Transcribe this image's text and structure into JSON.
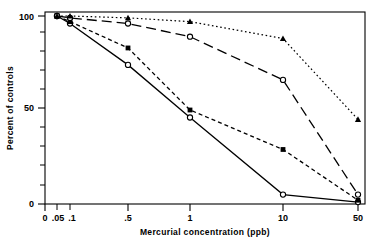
{
  "chart_data": {
    "type": "line",
    "title": "",
    "xlabel": "Mercurial concentration (ppb)",
    "ylabel": "Percent of controls",
    "x": [
      0.05,
      0.1,
      0.5,
      1,
      10,
      50
    ],
    "xtick_labels": [
      "0",
      ".05",
      ".1",
      ".5",
      "1",
      "10",
      "50"
    ],
    "ytick_labels": [
      "0",
      "50",
      "100"
    ],
    "ylim": [
      0,
      100
    ],
    "grid": false,
    "legend": "none",
    "series": [
      {
        "name": "open-circle-solid",
        "marker": "open-circle",
        "line": "solid",
        "x": [
          0.05,
          0.1,
          0.5,
          1,
          10,
          50
        ],
        "values": [
          100,
          96,
          74,
          46,
          5,
          1
        ]
      },
      {
        "name": "filled-square-short-dash",
        "marker": "filled-square",
        "line": "short-dash",
        "x": [
          0.05,
          0.1,
          0.5,
          1,
          10,
          50
        ],
        "values": [
          100,
          97,
          83,
          50,
          29,
          2
        ]
      },
      {
        "name": "open-circle-long-dash",
        "marker": "open-circle",
        "line": "long-dash",
        "x": [
          0.05,
          0.1,
          0.5,
          1,
          10,
          50
        ],
        "values": [
          100,
          99,
          96,
          89,
          66,
          5
        ]
      },
      {
        "name": "filled-triangle-dotted",
        "marker": "filled-triangle",
        "line": "dotted",
        "x": [
          0.05,
          0.1,
          0.5,
          1,
          10,
          50
        ],
        "values": [
          100,
          100,
          99,
          97,
          88,
          45
        ]
      }
    ],
    "axis_color": "#000000",
    "series_color": "#000000"
  }
}
